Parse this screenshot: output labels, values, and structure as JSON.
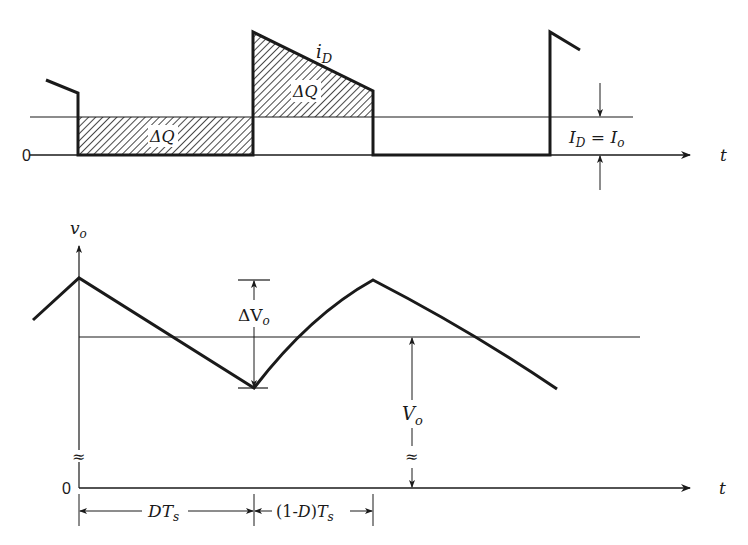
{
  "diagram": {
    "top_plot": {
      "waveform_label": "i",
      "waveform_label_sub": "D",
      "zero_label": "0",
      "area_label_1": "ΔQ",
      "area_label_2": "ΔQ",
      "avg_label_lhs": "I",
      "avg_label_lhs_sub": "D",
      "avg_label_eq": " = ",
      "avg_label_rhs": "I",
      "avg_label_rhs_sub": "o",
      "time_axis_label": "t"
    },
    "bottom_plot": {
      "y_axis_label": "v",
      "y_axis_label_sub": "o",
      "zero_label": "0",
      "ripple_label": "ΔV",
      "ripple_label_sub": "o",
      "avg_label": "V",
      "avg_label_sub": "o",
      "time_axis_label": "t",
      "break_symbol": "≈",
      "interval_1_label": "DT",
      "interval_1_sub": "s",
      "interval_2_label": "(1-D)T",
      "interval_2_sub": "s"
    },
    "colors": {
      "ink": "#1a1a1a",
      "background": "#ffffff"
    }
  }
}
